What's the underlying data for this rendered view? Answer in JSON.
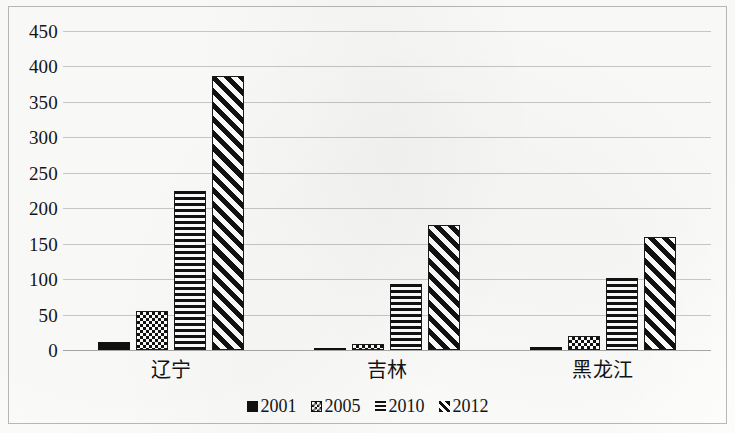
{
  "chart_data": {
    "type": "bar",
    "title": "",
    "xlabel": "",
    "ylabel": "",
    "ylim": [
      0,
      450
    ],
    "yticks": [
      450,
      400,
      350,
      300,
      250,
      200,
      150,
      100,
      50,
      0
    ],
    "grid": true,
    "legend_position": "bottom",
    "categories": [
      "辽宁",
      "吉林",
      "黑龙江"
    ],
    "series": [
      {
        "name": "2001",
        "pattern": "solid",
        "values": [
          11,
          2,
          4
        ]
      },
      {
        "name": "2005",
        "pattern": "checker",
        "values": [
          55,
          8,
          20
        ]
      },
      {
        "name": "2010",
        "pattern": "hlines",
        "values": [
          225,
          93,
          102
        ]
      },
      {
        "name": "2012",
        "pattern": "diagonal",
        "values": [
          387,
          177,
          160
        ]
      }
    ]
  },
  "axis": {
    "yticks": [
      "450",
      "400",
      "350",
      "300",
      "250",
      "200",
      "150",
      "100",
      "50",
      "0"
    ]
  },
  "categories": {
    "c0": "辽宁",
    "c1": "吉林",
    "c2": "黑龙江"
  },
  "legend": {
    "items": [
      {
        "label": "2001",
        "swatch": "solid-square-icon"
      },
      {
        "label": "2005",
        "swatch": "checker-square-icon"
      },
      {
        "label": "2010",
        "swatch": "hlines-square-icon"
      },
      {
        "label": "2012",
        "swatch": "diagonal-square-icon"
      }
    ]
  }
}
